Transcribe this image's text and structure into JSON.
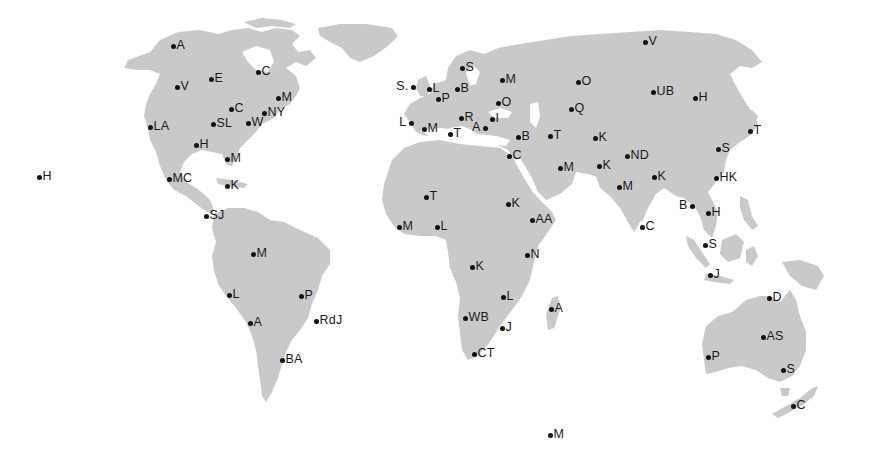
{
  "map": {
    "land_color": "#c9c9c9",
    "background": "#ffffff",
    "dot_color": "#111111"
  },
  "cities": [
    {
      "label": "A",
      "x": 173,
      "y": 47,
      "region": "north-america"
    },
    {
      "label": "V",
      "x": 177,
      "y": 88,
      "region": "north-america"
    },
    {
      "label": "E",
      "x": 211,
      "y": 80,
      "region": "north-america"
    },
    {
      "label": "C",
      "x": 258,
      "y": 73,
      "region": "north-america"
    },
    {
      "label": "M",
      "x": 278,
      "y": 99,
      "region": "north-america"
    },
    {
      "label": "C",
      "x": 231,
      "y": 110,
      "region": "north-america"
    },
    {
      "label": "NY",
      "x": 264,
      "y": 114,
      "region": "north-america"
    },
    {
      "label": "LA",
      "x": 150,
      "y": 128,
      "region": "north-america"
    },
    {
      "label": "SL",
      "x": 213,
      "y": 125,
      "region": "north-america"
    },
    {
      "label": "W",
      "x": 248,
      "y": 124,
      "region": "north-america"
    },
    {
      "label": "H",
      "x": 196,
      "y": 146,
      "region": "north-america"
    },
    {
      "label": "M",
      "x": 227,
      "y": 160,
      "region": "north-america"
    },
    {
      "label": "H",
      "x": 39,
      "y": 178,
      "region": "pacific"
    },
    {
      "label": "MC",
      "x": 169,
      "y": 180,
      "region": "north-america"
    },
    {
      "label": "K",
      "x": 227,
      "y": 187,
      "region": "caribbean"
    },
    {
      "label": "SJ",
      "x": 206,
      "y": 217,
      "region": "central-america"
    },
    {
      "label": "M",
      "x": 253,
      "y": 255,
      "region": "south-america"
    },
    {
      "label": "L",
      "x": 229,
      "y": 296,
      "region": "south-america"
    },
    {
      "label": "P",
      "x": 301,
      "y": 297,
      "region": "south-america"
    },
    {
      "label": "A",
      "x": 250,
      "y": 324,
      "region": "south-america"
    },
    {
      "label": "RdJ",
      "x": 316,
      "y": 322,
      "region": "south-america"
    },
    {
      "label": "BA",
      "x": 282,
      "y": 361,
      "region": "south-america"
    },
    {
      "label": "S",
      "x": 462,
      "y": 69,
      "region": "europe"
    },
    {
      "label": "S.",
      "x": 413,
      "y": 88,
      "region": "europe",
      "side": "left"
    },
    {
      "label": "L",
      "x": 429,
      "y": 90,
      "region": "europe"
    },
    {
      "label": "B",
      "x": 457,
      "y": 90,
      "region": "europe"
    },
    {
      "label": "M",
      "x": 502,
      "y": 81,
      "region": "europe"
    },
    {
      "label": "P",
      "x": 438,
      "y": 100,
      "region": "europe"
    },
    {
      "label": "O",
      "x": 498,
      "y": 104,
      "region": "europe"
    },
    {
      "label": "R",
      "x": 461,
      "y": 119,
      "region": "europe"
    },
    {
      "label": "I",
      "x": 492,
      "y": 120,
      "region": "europe"
    },
    {
      "label": "L",
      "x": 411,
      "y": 124,
      "region": "europe",
      "side": "left"
    },
    {
      "label": "M",
      "x": 424,
      "y": 130,
      "region": "europe"
    },
    {
      "label": "T",
      "x": 450,
      "y": 135,
      "region": "africa"
    },
    {
      "label": "A",
      "x": 485,
      "y": 129,
      "region": "europe",
      "side": "left"
    },
    {
      "label": "B",
      "x": 518,
      "y": 138,
      "region": "middle-east"
    },
    {
      "label": "C",
      "x": 509,
      "y": 157,
      "region": "africa"
    },
    {
      "label": "T",
      "x": 550,
      "y": 137,
      "region": "middle-east"
    },
    {
      "label": "O",
      "x": 578,
      "y": 83,
      "region": "asia"
    },
    {
      "label": "Q",
      "x": 571,
      "y": 110,
      "region": "asia"
    },
    {
      "label": "V",
      "x": 645,
      "y": 43,
      "region": "asia"
    },
    {
      "label": "UB",
      "x": 653,
      "y": 93,
      "region": "asia"
    },
    {
      "label": "H",
      "x": 695,
      "y": 99,
      "region": "asia"
    },
    {
      "label": "K",
      "x": 595,
      "y": 139,
      "region": "asia"
    },
    {
      "label": "M",
      "x": 560,
      "y": 169,
      "region": "middle-east"
    },
    {
      "label": "K",
      "x": 599,
      "y": 167,
      "region": "asia"
    },
    {
      "label": "ND",
      "x": 627,
      "y": 157,
      "region": "asia"
    },
    {
      "label": "M",
      "x": 619,
      "y": 188,
      "region": "asia"
    },
    {
      "label": "K",
      "x": 654,
      "y": 178,
      "region": "asia"
    },
    {
      "label": "T",
      "x": 750,
      "y": 132,
      "region": "asia"
    },
    {
      "label": "S",
      "x": 718,
      "y": 150,
      "region": "asia"
    },
    {
      "label": "HK",
      "x": 716,
      "y": 179,
      "region": "asia"
    },
    {
      "label": "T",
      "x": 426,
      "y": 198,
      "region": "africa"
    },
    {
      "label": "K",
      "x": 508,
      "y": 205,
      "region": "africa"
    },
    {
      "label": "M",
      "x": 399,
      "y": 228,
      "region": "africa"
    },
    {
      "label": "L",
      "x": 437,
      "y": 228,
      "region": "africa"
    },
    {
      "label": "AA",
      "x": 532,
      "y": 221,
      "region": "africa"
    },
    {
      "label": "N",
      "x": 527,
      "y": 256,
      "region": "africa"
    },
    {
      "label": "K",
      "x": 472,
      "y": 268,
      "region": "africa"
    },
    {
      "label": "L",
      "x": 503,
      "y": 298,
      "region": "africa"
    },
    {
      "label": "A",
      "x": 551,
      "y": 310,
      "region": "africa"
    },
    {
      "label": "WB",
      "x": 465,
      "y": 319,
      "region": "africa"
    },
    {
      "label": "J",
      "x": 502,
      "y": 329,
      "region": "africa"
    },
    {
      "label": "CT",
      "x": 474,
      "y": 355,
      "region": "africa"
    },
    {
      "label": "B",
      "x": 692,
      "y": 207,
      "region": "southeast-asia",
      "side": "left"
    },
    {
      "label": "H",
      "x": 708,
      "y": 214,
      "region": "southeast-asia"
    },
    {
      "label": "C",
      "x": 642,
      "y": 228,
      "region": "asia"
    },
    {
      "label": "S",
      "x": 705,
      "y": 246,
      "region": "southeast-asia"
    },
    {
      "label": "J",
      "x": 710,
      "y": 276,
      "region": "southeast-asia"
    },
    {
      "label": "D",
      "x": 769,
      "y": 299,
      "region": "oceania"
    },
    {
      "label": "AS",
      "x": 763,
      "y": 338,
      "region": "oceania"
    },
    {
      "label": "P",
      "x": 708,
      "y": 358,
      "region": "oceania"
    },
    {
      "label": "S",
      "x": 783,
      "y": 371,
      "region": "oceania"
    },
    {
      "label": "C",
      "x": 793,
      "y": 407,
      "region": "oceania"
    },
    {
      "label": "M",
      "x": 550,
      "y": 436,
      "region": "antarctica"
    }
  ]
}
